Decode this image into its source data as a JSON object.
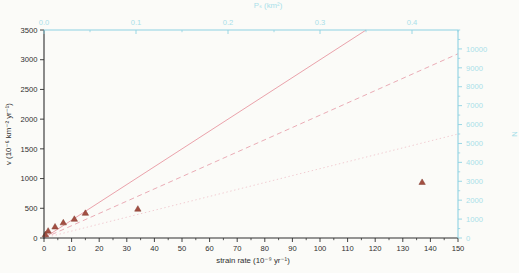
{
  "page": {
    "background": "#fbfbf8"
  },
  "chart_data": {
    "type": "scatter",
    "title": "",
    "plot_area": {
      "left": 44,
      "top": 30,
      "right": 458,
      "bottom": 238
    },
    "axes": {
      "bottom": {
        "label": "strain rate (10⁻⁹ yr⁻¹)",
        "min": 0,
        "max": 150,
        "tick_values": [
          0,
          10,
          20,
          30,
          40,
          50,
          60,
          70,
          80,
          90,
          100,
          110,
          120,
          130,
          140,
          150
        ],
        "tick_labels": [
          "0",
          "10",
          "20",
          "30",
          "40",
          "50",
          "60",
          "70",
          "80",
          "90",
          "100",
          "110",
          "120",
          "130",
          "140",
          "150"
        ],
        "minor_step": 5,
        "color": "#2e2e2e",
        "label_color": "#2e2e2e"
      },
      "left": {
        "label": "v (10⁻⁶ km⁻² yr⁻¹)",
        "min": 0,
        "max": 3500,
        "tick_values": [
          0,
          500,
          1000,
          1500,
          2000,
          2500,
          3000,
          3500
        ],
        "tick_labels": [
          "0",
          "500",
          "1000",
          "1500",
          "2000",
          "2500",
          "3000",
          "3500"
        ],
        "minor_step": 0,
        "color": "#2e2e2e",
        "label_color": "#2e2e2e"
      },
      "top": {
        "label": "Pₛ (km²)",
        "min": 0,
        "max": 0.45,
        "tick_values": [
          0.0,
          0.1,
          0.2,
          0.3,
          0.4
        ],
        "tick_labels": [
          "0.0",
          "0.1",
          "0.2",
          "0.3",
          "0.4"
        ],
        "minor_step": 0.05,
        "color": "#8ed2e2",
        "label_color": "#a9dfe9"
      },
      "right": {
        "label": "N",
        "min": 0,
        "max": 11000,
        "tick_values": [
          0,
          1000,
          2000,
          3000,
          4000,
          5000,
          6000,
          7000,
          8000,
          9000,
          10000
        ],
        "tick_labels": [
          "0",
          "1000",
          "2000",
          "3000",
          "4000",
          "5000",
          "6000",
          "7000",
          "8000",
          "9000",
          "10000"
        ],
        "minor_step": 500,
        "color": "#8ed2e2",
        "label_color": "#a9dfe9"
      }
    },
    "series": {
      "points": {
        "name": "measured-vent-density",
        "marker": "triangle",
        "fill": "#a34f42",
        "edge": "#803a2f",
        "data": [
          [
            0.5,
            60
          ],
          [
            1.5,
            120
          ],
          [
            4,
            190
          ],
          [
            7,
            260
          ],
          [
            11,
            320
          ],
          [
            15,
            420
          ],
          [
            34,
            490
          ],
          [
            137,
            940
          ]
        ]
      },
      "lines": [
        {
          "name": "solid-trend",
          "style": "solid",
          "color": "#e897a1",
          "from": [
            0,
            0
          ],
          "to": [
            116.7,
            3500
          ]
        },
        {
          "name": "dashed-trend",
          "style": "dashed",
          "color": "#e8a3ae",
          "from": [
            0,
            0
          ],
          "to": [
            150,
            3100
          ]
        },
        {
          "name": "dotted-trend",
          "style": "dotted",
          "color": "#efc6cd",
          "from": [
            0,
            0
          ],
          "to": [
            150,
            1750
          ]
        }
      ]
    }
  }
}
